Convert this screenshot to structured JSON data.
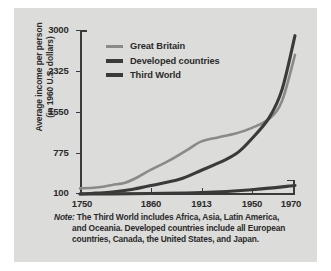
{
  "figure": {
    "background_color": "#dcdcda",
    "axis_color": "#3a3a3a",
    "text_color": "#2b2b2b"
  },
  "axis": {
    "ytitle_line1": "Average income per person",
    "ytitle_line2": "(in 1960 U.S. dollars)",
    "yticks": [
      "3000",
      "2325",
      "1550",
      "775",
      "100"
    ],
    "xticks": [
      "1750",
      "1860",
      "1913",
      "1950",
      "1970"
    ]
  },
  "legend": {
    "items": [
      {
        "label": "Great Britain",
        "color": "#8a8a88",
        "weight": "thin"
      },
      {
        "label": "Developed countries",
        "color": "#3a3a3a",
        "weight": "thick"
      },
      {
        "label": "Third World",
        "color": "#3a3a3a",
        "weight": "thick"
      }
    ]
  },
  "note": {
    "word": "Note:",
    "line1": " The Third World includes Africa, Asia, Latin America,",
    "line2": "and Oceania. Developed countries include all European",
    "line3": "countries, Canada, the United States, and Japan."
  },
  "chart_data": {
    "type": "line",
    "title": "",
    "xlabel": "",
    "ylabel": "Average income per person (in 1960 U.S. dollars)",
    "xlim": [
      1750,
      1970
    ],
    "ylim": [
      100,
      3000
    ],
    "yticks": [
      100,
      775,
      1550,
      2325,
      3000
    ],
    "xticks": [
      1750,
      1860,
      1913,
      1950,
      1970
    ],
    "xtick_positions_fraction": [
      0.0,
      0.33,
      0.565,
      0.8,
      1.0
    ],
    "grid": false,
    "legend_position": "upper-left-inside",
    "series": [
      {
        "name": "Great Britain",
        "color": "#8a8a88",
        "x": [
          1750,
          1775,
          1800,
          1820,
          1840,
          1860,
          1880,
          1900,
          1913,
          1925,
          1938,
          1950,
          1958,
          1964,
          1970
        ],
        "y": [
          200,
          215,
          260,
          300,
          400,
          530,
          700,
          900,
          1030,
          1100,
          1170,
          1270,
          1430,
          1750,
          2560
        ]
      },
      {
        "name": "Developed countries",
        "color": "#3a3a3a",
        "x": [
          1750,
          1775,
          1800,
          1830,
          1860,
          1890,
          1913,
          1930,
          1940,
          1950,
          1958,
          1964,
          1970
        ],
        "y": [
          100,
          115,
          135,
          180,
          250,
          360,
          520,
          700,
          840,
          1080,
          1450,
          1950,
          2900
        ]
      },
      {
        "name": "Third World",
        "color": "#3a3a3a",
        "x": [
          1750,
          1800,
          1860,
          1913,
          1950,
          1970
        ],
        "y": [
          100,
          102,
          110,
          125,
          175,
          250
        ]
      }
    ],
    "note": "Note: The Third World includes Africa, Asia, Latin America, and Oceania. Developed countries include all European countries, Canada, the United States, and Japan."
  }
}
